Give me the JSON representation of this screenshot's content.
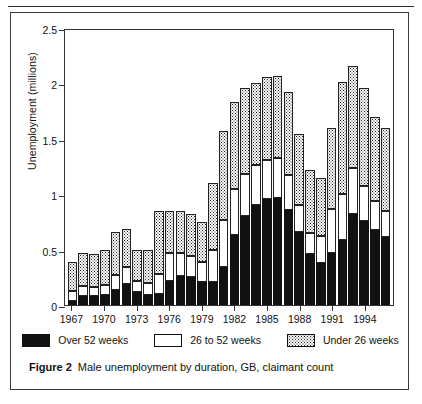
{
  "figure": {
    "caption_label": "Figure 2",
    "caption_text": "Male unemployment by duration, GB, claimant count"
  },
  "legend": {
    "position": "bottom",
    "items": [
      {
        "key": "over52",
        "label": "Over 52 weeks",
        "swatch": "solid-black"
      },
      {
        "key": "26to52",
        "label": "26 to 52 weeks",
        "swatch": "white-outline"
      },
      {
        "key": "under26",
        "label": "Under 26 weeks",
        "swatch": "dotted-stipple"
      }
    ]
  },
  "chart_data": {
    "type": "bar",
    "stacked": true,
    "title": "Male unemployment by duration, GB, claimant count",
    "xlabel": "",
    "ylabel": "Unemployment (millions)",
    "ylim": [
      0,
      2.5
    ],
    "yticks": [
      0,
      0.5,
      1,
      1.5,
      2,
      2.5
    ],
    "ytick_labels": [
      "0",
      "0.5",
      "1",
      "1.5",
      "2",
      "2.5"
    ],
    "grid": false,
    "x": [
      1967,
      1968,
      1969,
      1970,
      1971,
      1972,
      1973,
      1974,
      1975,
      1976,
      1977,
      1978,
      1979,
      1980,
      1981,
      1982,
      1983,
      1984,
      1985,
      1986,
      1987,
      1988,
      1989,
      1990,
      1991,
      1992,
      1993,
      1994,
      1995,
      1996
    ],
    "xtick_labels": [
      "1967",
      "1970",
      "1973",
      "1976",
      "1979",
      "1982",
      "1985",
      "1988",
      "1991",
      "1994"
    ],
    "xtick_values": [
      1967,
      1970,
      1973,
      1976,
      1979,
      1982,
      1985,
      1988,
      1991,
      1994
    ],
    "categories": [
      "1967",
      "1968",
      "1969",
      "1970",
      "1971",
      "1972",
      "1973",
      "1974",
      "1975",
      "1976",
      "1977",
      "1978",
      "1979",
      "1980",
      "1981",
      "1982",
      "1983",
      "1984",
      "1985",
      "1986",
      "1987",
      "1988",
      "1989",
      "1990",
      "1991",
      "1992",
      "1993",
      "1994",
      "1995",
      "1996"
    ],
    "series": [
      {
        "name": "Over 52 weeks",
        "key": "over52",
        "values": [
          0.04,
          0.08,
          0.08,
          0.09,
          0.14,
          0.19,
          0.12,
          0.09,
          0.1,
          0.22,
          0.26,
          0.25,
          0.21,
          0.21,
          0.34,
          0.63,
          0.8,
          0.9,
          0.96,
          0.97,
          0.86,
          0.66,
          0.46,
          0.38,
          0.47,
          0.59,
          0.82,
          0.76,
          0.68,
          0.61
        ]
      },
      {
        "name": "26 to 52 weeks",
        "key": "26to52",
        "values": [
          0.09,
          0.09,
          0.08,
          0.09,
          0.13,
          0.15,
          0.1,
          0.11,
          0.18,
          0.25,
          0.21,
          0.19,
          0.18,
          0.29,
          0.43,
          0.42,
          0.38,
          0.36,
          0.35,
          0.36,
          0.31,
          0.24,
          0.19,
          0.24,
          0.4,
          0.41,
          0.42,
          0.31,
          0.26,
          0.24
        ]
      },
      {
        "name": "Under 26 weeks",
        "key": "under26",
        "values": [
          0.26,
          0.3,
          0.3,
          0.32,
          0.39,
          0.35,
          0.28,
          0.3,
          0.57,
          0.38,
          0.38,
          0.38,
          0.36,
          0.6,
          0.8,
          0.78,
          0.78,
          0.74,
          0.75,
          0.74,
          0.75,
          0.64,
          0.57,
          0.53,
          0.73,
          1.01,
          0.92,
          0.89,
          0.76,
          0.75
        ]
      }
    ],
    "totals": [
      0.39,
      0.47,
      0.46,
      0.5,
      0.66,
      0.69,
      0.5,
      0.5,
      0.85,
      0.85,
      0.85,
      0.82,
      0.75,
      1.1,
      1.57,
      1.83,
      1.96,
      2.0,
      2.06,
      2.07,
      1.92,
      1.54,
      1.22,
      1.15,
      1.6,
      2.01,
      2.16,
      1.96,
      1.7,
      1.6
    ]
  },
  "colors": {
    "over52": "#111111",
    "26to52": "#ffffff",
    "under26_stipple": "#1a1a1a",
    "axis": "#333333",
    "frame": "#3a3a3a",
    "text": "#111111"
  }
}
